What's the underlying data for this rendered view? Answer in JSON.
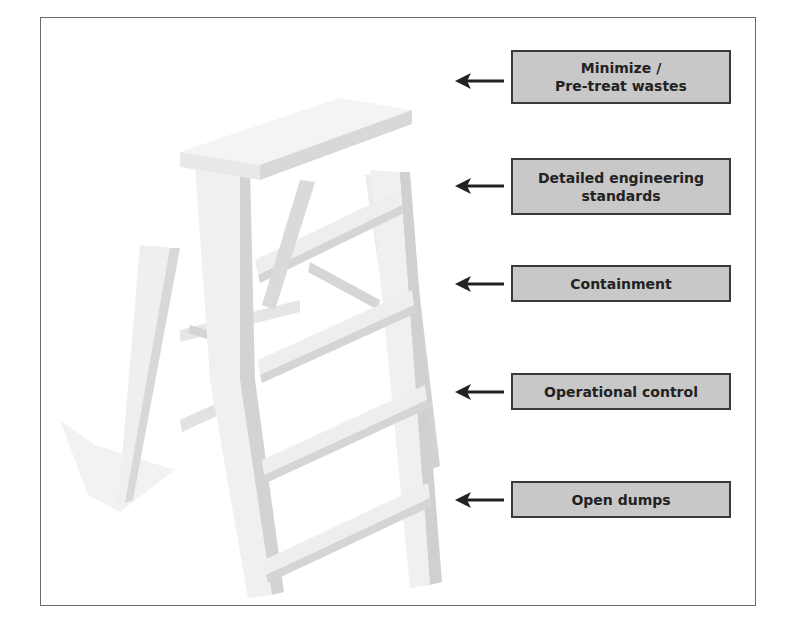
{
  "diagram": {
    "type": "ladder",
    "colors": {
      "box_fill": "#c8c8c8",
      "box_border": "#3a3a3a",
      "text": "#222222",
      "arrow": "#222222",
      "frame": "#6a6a6a",
      "ladder_light": "#f0f0f0",
      "ladder_shade": "#d2d2d2"
    },
    "rungs": [
      {
        "label_line1": "Minimize /",
        "label_line2": "Pre-treat wastes",
        "arrow_icon": "arrow-left-icon"
      },
      {
        "label_line1": "Detailed engineering",
        "label_line2": "standards",
        "arrow_icon": "arrow-left-icon"
      },
      {
        "label_line1": "Containment",
        "label_line2": "",
        "arrow_icon": "arrow-left-icon"
      },
      {
        "label_line1": "Operational control",
        "label_line2": "",
        "arrow_icon": "arrow-left-icon"
      },
      {
        "label_line1": "Open dumps",
        "label_line2": "",
        "arrow_icon": "arrow-left-icon"
      }
    ]
  }
}
